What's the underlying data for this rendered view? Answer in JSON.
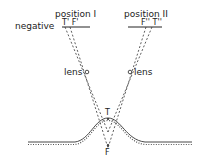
{
  "labels": {
    "position1": "position I",
    "position2": "position II",
    "negative": "negative",
    "t1f1": "T' F'",
    "f2t2": "F'' T''",
    "lens_left": "lens",
    "lens_right": "lens",
    "t": "T",
    "f": "F"
  }
}
